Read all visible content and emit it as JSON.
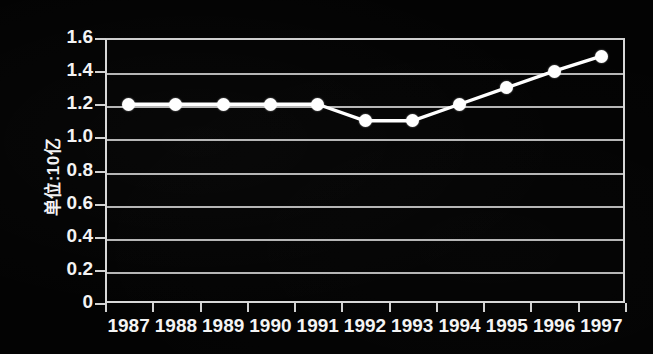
{
  "chart_data": {
    "type": "line",
    "title": "",
    "subtitle": "",
    "xlabel": "",
    "ylabel": "单位:10亿",
    "categories": [
      "1987",
      "1988",
      "1989",
      "1990",
      "1991",
      "1992",
      "1993",
      "1994",
      "1995",
      "1996",
      "1997"
    ],
    "values": [
      1.2,
      1.2,
      1.2,
      1.2,
      1.2,
      1.1,
      1.1,
      1.2,
      1.3,
      1.4,
      1.49
    ],
    "series": [
      {
        "name": "",
        "values": [
          1.2,
          1.2,
          1.2,
          1.2,
          1.2,
          1.1,
          1.1,
          1.2,
          1.3,
          1.4,
          1.49
        ]
      }
    ],
    "ylim": [
      0,
      1.6
    ],
    "yticks": [
      "0",
      "0.2",
      "0.4",
      "0.6",
      "0.8",
      "1.0",
      "1.2",
      "1.4",
      "1.6"
    ],
    "ytick_values": [
      0,
      0.2,
      0.4,
      0.6,
      0.8,
      1.0,
      1.2,
      1.4,
      1.6
    ],
    "grid": true,
    "grid_axis": "y",
    "legend": false,
    "legend_position": "none",
    "marker": "circle",
    "annotations": []
  },
  "style": {
    "background_color": "#030303",
    "line_color": "#ffffff",
    "marker_color": "#ffffff",
    "grid_color": "#b6b6b6",
    "axis_color": "#d8d8d8",
    "text_color": "#f4f4f4"
  }
}
